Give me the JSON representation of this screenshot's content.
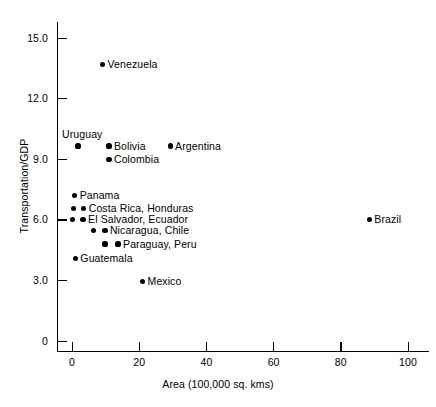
{
  "chart_data": {
    "type": "scatter",
    "title": "",
    "xlabel": "Area (100,000 sq. kms)",
    "ylabel": "Transportation/GDP",
    "xlim": [
      0,
      105
    ],
    "ylim": [
      0,
      16.2
    ],
    "xticks": [
      0,
      20,
      40,
      60,
      80,
      100
    ],
    "xtick_labels": [
      "0",
      "20",
      "40",
      "60",
      "80",
      "100"
    ],
    "yticks": [
      0,
      3.0,
      6.0,
      9.0,
      12.0,
      15.0
    ],
    "ytick_labels": [
      "0",
      "3.0",
      "6.0",
      "9.0",
      "12.0",
      "15.0"
    ],
    "grid": false,
    "legend": false,
    "marker": "filled-circle",
    "marker_color": "#000000",
    "points": [
      {
        "label": "Venezuela",
        "x": 9.1,
        "y": 13.7,
        "label_pos": "right"
      },
      {
        "label": "Uruguay",
        "x": 1.8,
        "y": 9.65,
        "label_pos": "above"
      },
      {
        "label": "Bolivia",
        "x": 11.0,
        "y": 9.65,
        "label_pos": "right"
      },
      {
        "label": "Argentina",
        "x": 29.2,
        "y": 9.65,
        "label_pos": "right"
      },
      {
        "label": "Colombia",
        "x": 11.0,
        "y": 9.0,
        "label_pos": "right"
      },
      {
        "label": "Panama",
        "x": 0.8,
        "y": 7.2,
        "label_pos": "right"
      },
      {
        "label": "Costa Rica, Honduras",
        "x": 0.5,
        "y": 6.55,
        "label_pos": "pair-right",
        "x2": 3.5
      },
      {
        "label": "El Salvador, Ecuador",
        "x": 0.2,
        "y": 6.0,
        "label_pos": "pair-right",
        "x2": 3.3
      },
      {
        "label": "Nicaragua, Chile",
        "x": 6.5,
        "y": 5.45,
        "label_pos": "pair-right",
        "x2": 9.8
      },
      {
        "label": "Paraguay, Peru",
        "x": 9.8,
        "y": 4.8,
        "label_pos": "pair-right",
        "x2": 13.7
      },
      {
        "label": "Guatemala",
        "x": 1.0,
        "y": 4.1,
        "label_pos": "right"
      },
      {
        "label": "Mexico",
        "x": 21.0,
        "y": 2.95,
        "label_pos": "right"
      },
      {
        "label": "Brazil",
        "x": 88.5,
        "y": 6.0,
        "label_pos": "right"
      }
    ]
  }
}
